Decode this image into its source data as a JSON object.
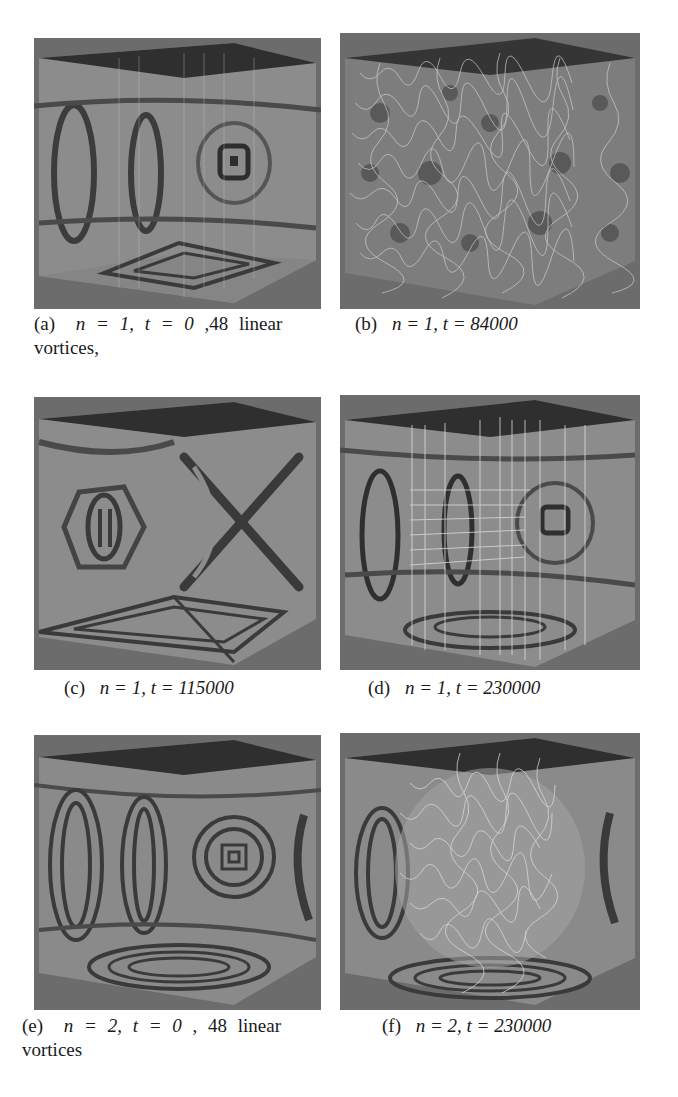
{
  "figure": {
    "panels": [
      {
        "id": "a",
        "label": "(a)",
        "caption_math": "n = 1, t = 0",
        "caption_text": ",48 linear",
        "caption_line2": "vortices,",
        "n": 1,
        "t": 0,
        "description": "48 linear vortices, fringe pattern on cube faces"
      },
      {
        "id": "b",
        "label": "(b)",
        "caption_math": "n = 1, t = 84000",
        "caption_text": "",
        "caption_line2": "",
        "n": 1,
        "t": 84000,
        "description": "dense tangle of vortex lines inside cube"
      },
      {
        "id": "c",
        "label": "(c)",
        "caption_math": "n = 1, t = 115000",
        "caption_text": "",
        "caption_line2": "",
        "n": 1,
        "t": 115000,
        "description": "fringe pattern with X-shaped structure"
      },
      {
        "id": "d",
        "label": "(d)",
        "caption_math": "n = 1, t = 230000",
        "caption_text": "",
        "caption_line2": "",
        "n": 1,
        "t": 230000,
        "description": "reconnected vertical vortex lines with fringe pattern"
      },
      {
        "id": "e",
        "label": "(e)",
        "caption_math": "n = 2, t = 0",
        "caption_text": ", 48 linear",
        "caption_line2": "vortices",
        "n": 2,
        "t": 0,
        "description": "48 linear vortices, denser fringe pattern"
      },
      {
        "id": "f",
        "label": "(f)",
        "caption_math": "n = 2, t = 230000",
        "caption_text": "",
        "caption_line2": "",
        "n": 2,
        "t": 230000,
        "description": "central vortex tangle with fringe pattern"
      }
    ],
    "colors": {
      "background": "#ffffff",
      "panel_gray": "#6e6e6e",
      "cube_face": "#8a8a8a",
      "fringe_dark": "#3a3a3a",
      "top_face": "#2e2e2e",
      "vortex_line": "#d8d8d8"
    }
  }
}
